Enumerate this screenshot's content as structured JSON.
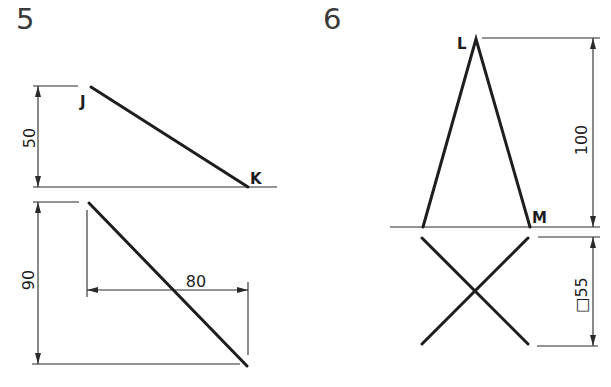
{
  "figures": [
    {
      "number": "5",
      "points": {
        "a": "J",
        "b": "K"
      },
      "dimensions": {
        "front_height": "50",
        "top_depth": "90",
        "top_width": "80"
      }
    },
    {
      "number": "6",
      "points": {
        "a": "L",
        "b": "M"
      },
      "dimensions": {
        "front_height": "100",
        "top_square": "□55"
      }
    }
  ],
  "colors": {
    "line": "#1e1e1e",
    "background": "#ffffff"
  }
}
